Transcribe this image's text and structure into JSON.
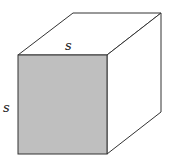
{
  "diagram": {
    "type": "cube",
    "labels": {
      "top_edge": "s",
      "left_edge": "s"
    },
    "colors": {
      "front_face": "#bfbfbf",
      "stroke": "#333333",
      "background": "#ffffff"
    }
  }
}
